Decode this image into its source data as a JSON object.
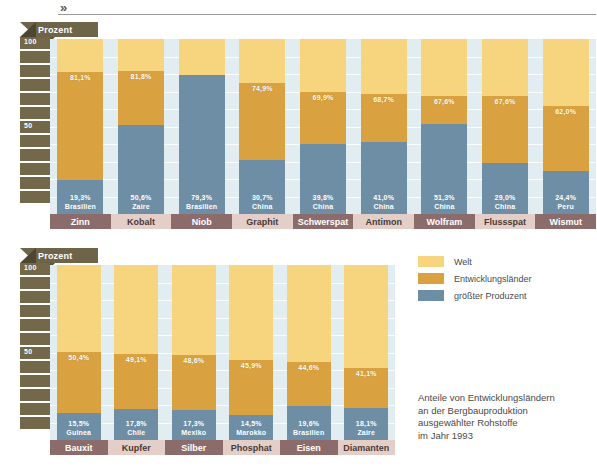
{
  "page": {
    "corner_mark": "»"
  },
  "legend": {
    "items": [
      {
        "label": "Welt",
        "color": "#f6d57e"
      },
      {
        "label": "Entwicklungsländer",
        "color": "#d9a13f"
      },
      {
        "label": "größter Produzent",
        "color": "#6d8ea5"
      }
    ]
  },
  "caption": {
    "lines": [
      "Anteile von Entwicklungsländern",
      "an der Bergbauproduktion",
      "ausgewählter Rohstoffe",
      "im Jahr 1993"
    ]
  },
  "chart_data": [
    {
      "type": "bar",
      "title": "",
      "axis_label": "Prozent",
      "ylabel": "Prozent",
      "xlabel": "",
      "ylim": [
        0,
        100
      ],
      "yticks": [
        50,
        100
      ],
      "ytick_labels": [
        "50",
        "100"
      ],
      "grid": true,
      "stacked": true,
      "legend_position": "right",
      "categories": [
        "Zinn",
        "Kobalt",
        "Niob",
        "Graphit",
        "Schwerspat",
        "Antimon",
        "Wolfram",
        "Flussspat",
        "Wismut"
      ],
      "series": [
        {
          "name": "Welt",
          "color": "#f6d57e",
          "values": [
            100,
            100,
            100,
            100,
            100,
            100,
            100,
            100,
            100
          ]
        },
        {
          "name": "Entwicklungsländer",
          "color": "#d9a13f",
          "values": [
            81.1,
            81.8,
            79.6,
            74.9,
            69.9,
            68.7,
            67.6,
            67.6,
            62.0
          ]
        },
        {
          "name": "größter Produzent",
          "color": "#6d8ea5",
          "values": [
            19.3,
            50.6,
            79.3,
            30.7,
            39.8,
            41.0,
            51.3,
            29.0,
            24.4
          ]
        }
      ],
      "dev_labels": [
        "81,1%",
        "81,8%",
        "79,6%",
        "74,9%",
        "69,9%",
        "68,7%",
        "67,6%",
        "67,6%",
        "62,0%"
      ],
      "producer_value_labels": [
        "19,3%",
        "50,6%",
        "79,3%",
        "30,7%",
        "39,8%",
        "41,0%",
        "51,3%",
        "29,0%",
        "24,4%"
      ],
      "producer_country_labels": [
        "Brasilien",
        "Zaire",
        "Brasilien",
        "China",
        "China",
        "China",
        "China",
        "China",
        "Peru"
      ]
    },
    {
      "type": "bar",
      "title": "",
      "axis_label": "Prozent",
      "ylabel": "Prozent",
      "xlabel": "",
      "ylim": [
        0,
        100
      ],
      "yticks": [
        50,
        100
      ],
      "ytick_labels": [
        "50",
        "100"
      ],
      "grid": true,
      "stacked": true,
      "legend_position": "right",
      "categories": [
        "Bauxit",
        "Kupfer",
        "Silber",
        "Phosphat",
        "Eisen",
        "Diamanten"
      ],
      "series": [
        {
          "name": "Welt",
          "color": "#f6d57e",
          "values": [
            100,
            100,
            100,
            100,
            100,
            100
          ]
        },
        {
          "name": "Entwicklungsländer",
          "color": "#d9a13f",
          "values": [
            50.4,
            49.1,
            48.6,
            45.9,
            44.6,
            41.1
          ]
        },
        {
          "name": "größter Produzent",
          "color": "#6d8ea5",
          "values": [
            15.5,
            17.8,
            17.3,
            14.5,
            19.6,
            18.1
          ]
        }
      ],
      "dev_labels": [
        "50,4%",
        "49,1%",
        "48,6%",
        "45,9%",
        "44,6%",
        "41,1%"
      ],
      "producer_value_labels": [
        "15,5%",
        "17,8%",
        "17,3%",
        "14,5%",
        "19,6%",
        "18,1%"
      ],
      "producer_country_labels": [
        "Guinea",
        "Chile",
        "Mexiko",
        "Marokko",
        "Brasilien",
        "Zaire"
      ]
    }
  ]
}
